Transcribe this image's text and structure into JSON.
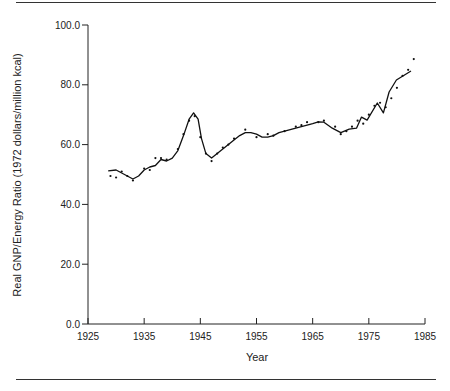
{
  "chart_data": {
    "type": "line",
    "title": "",
    "xlabel": "Year",
    "ylabel": "Real GNP/Energy Ratio (1972 dollars/million kcal)",
    "xlim": [
      1925,
      1985
    ],
    "ylim": [
      0,
      100
    ],
    "x_ticks": [
      1925,
      1935,
      1945,
      1955,
      1965,
      1975,
      1985
    ],
    "x_tick_labels": [
      "1925",
      "1935",
      "1945",
      "1955",
      "1965",
      "1975",
      "1985"
    ],
    "y_ticks": [
      0,
      20,
      40,
      60,
      80,
      100
    ],
    "y_tick_labels": [
      "0.0",
      "20.0",
      "40.0",
      "60.0",
      "80.0",
      "100.0"
    ],
    "grid": false,
    "legend": null,
    "series": [
      {
        "name": "Smoothed trend (line)",
        "style": "line",
        "x": [
          1928.6,
          1930,
          1931,
          1932,
          1933,
          1934,
          1935,
          1936,
          1937,
          1938,
          1939,
          1940,
          1941,
          1942,
          1943,
          1943.8,
          1944.6,
          1945.2,
          1946,
          1947,
          1948,
          1949,
          1950,
          1951,
          1952,
          1953,
          1954,
          1955,
          1956,
          1957,
          1958,
          1959,
          1960,
          1961,
          1962,
          1963,
          1964,
          1965,
          1966,
          1967,
          1968.5,
          1970,
          1971.5,
          1972.8,
          1973.7,
          1974.7,
          1976.5,
          1977.6,
          1978.6,
          1979.9,
          1982.5
        ],
        "y": [
          51.2,
          51.5,
          50.5,
          49.5,
          48.5,
          49.5,
          51.5,
          52.5,
          53.0,
          55.0,
          54.5,
          55.5,
          58.0,
          63.0,
          68.5,
          70.6,
          68.5,
          62.0,
          57.0,
          55.5,
          57.0,
          58.5,
          60.0,
          61.5,
          63.0,
          64.0,
          64.0,
          63.5,
          62.5,
          62.5,
          63.0,
          64.0,
          64.5,
          65.0,
          65.5,
          66.0,
          66.5,
          67.0,
          67.6,
          67.5,
          65.5,
          64.0,
          65.2,
          65.5,
          69.2,
          68.2,
          73.9,
          70.6,
          77.6,
          81.6,
          84.6
        ]
      },
      {
        "name": "Annual observations (points)",
        "style": "scatter",
        "x": [
          1929,
          1930,
          1931,
          1932,
          1933,
          1935,
          1936,
          1937,
          1938,
          1939,
          1941,
          1942,
          1943,
          1944,
          1945,
          1946,
          1947,
          1948,
          1949,
          1950,
          1951,
          1953,
          1955,
          1957,
          1958,
          1960,
          1962,
          1963,
          1964,
          1966,
          1967,
          1969,
          1970,
          1971,
          1972,
          1973,
          1974,
          1975,
          1976,
          1977,
          1978,
          1979,
          1980,
          1981,
          1982,
          1983
        ],
        "y": [
          49.5,
          49.0,
          51.0,
          49.5,
          48.0,
          52.0,
          51.5,
          55.5,
          55.5,
          55.0,
          58.5,
          63.5,
          68.0,
          69.5,
          62.5,
          57.0,
          54.5,
          57.0,
          59.0,
          60.0,
          62.0,
          65.0,
          62.5,
          63.5,
          63.0,
          64.5,
          66.0,
          66.5,
          67.5,
          67.5,
          68.0,
          66.0,
          63.5,
          64.5,
          66.0,
          68.0,
          67.0,
          70.0,
          73.0,
          74.0,
          72.5,
          75.5,
          79.0,
          83.0,
          85.0,
          88.6
        ]
      }
    ]
  }
}
